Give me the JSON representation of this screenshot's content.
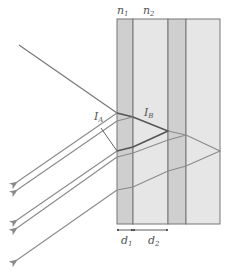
{
  "labels": {
    "n1": "n",
    "n1_sub": "1",
    "n2": "n",
    "n2_sub": "2",
    "d1": "d",
    "d1_sub": "1",
    "d2": "d",
    "d2_sub": "2",
    "IA": "I",
    "IA_sub": "A",
    "IB": "I",
    "IB_sub": "B"
  },
  "colors": {
    "layer_dark": "#cfcfcf",
    "layer_light": "#e6e6e6",
    "border": "#777777",
    "ray": "#8a8a8a",
    "ray_dark": "#555555"
  },
  "layers": [
    {
      "name": "n1-layer",
      "x0": 117,
      "x1": 133,
      "shade": "dark"
    },
    {
      "name": "n2-layer",
      "x0": 133,
      "x1": 168,
      "shade": "light"
    },
    {
      "name": "n1-layer-2",
      "x0": 168,
      "x1": 186,
      "shade": "dark"
    },
    {
      "name": "substrate",
      "x0": 186,
      "x1": 220,
      "shade": "light"
    }
  ]
}
